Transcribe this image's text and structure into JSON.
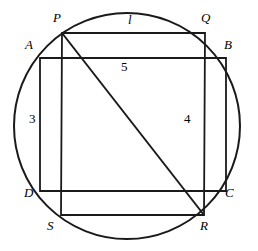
{
  "figure": {
    "background_color": "#ffffff",
    "stroke_color": "#1a1a1a"
  },
  "circle": {
    "name": "circumcircle",
    "center_x": 127,
    "center_y": 126,
    "radius": 113,
    "stroke_width": 2.0
  },
  "square_pqrs": {
    "name": "square-pqrs",
    "stroke_width": 1.8,
    "vertices": [
      {
        "label": "P",
        "x": 62,
        "y": 33,
        "label_x": 53,
        "label_y": 11
      },
      {
        "label": "Q",
        "x": 205,
        "y": 33,
        "label_x": 201,
        "label_y": 11
      },
      {
        "label": "R",
        "x": 204,
        "y": 215,
        "label_x": 200,
        "label_y": 219
      },
      {
        "label": "S",
        "x": 61,
        "y": 215,
        "label_x": 47,
        "label_y": 219
      }
    ]
  },
  "rectangle_abcd": {
    "name": "rectangle-abcd",
    "stroke_width": 1.8,
    "vertices": [
      {
        "label": "A",
        "x": 40,
        "y": 58,
        "label_x": 25,
        "label_y": 38
      },
      {
        "label": "B",
        "x": 226,
        "y": 58,
        "label_x": 224,
        "label_y": 38
      },
      {
        "label": "C",
        "x": 226,
        "y": 191,
        "label_x": 225,
        "label_y": 186
      },
      {
        "label": "D",
        "x": 40,
        "y": 191,
        "label_x": 24,
        "label_y": 186
      }
    ]
  },
  "diagonal": {
    "name": "diagonal-p-to-r",
    "from": "P",
    "to": "R",
    "x1": 62,
    "y1": 33,
    "x2": 204,
    "y2": 215,
    "stroke_width": 2.0
  },
  "measures": [
    {
      "id": "side-l",
      "text": "l",
      "x": 128,
      "y": 13,
      "italic": true,
      "description": "side PQ of square"
    },
    {
      "id": "width-3",
      "text": "3",
      "x": 29,
      "y": 112,
      "italic": false,
      "description": "side AD of rectangle"
    },
    {
      "id": "height-4",
      "text": "4",
      "x": 184,
      "y": 112,
      "italic": false,
      "description": "segment along right side"
    },
    {
      "id": "length-5",
      "text": "5",
      "x": 121,
      "y": 60,
      "italic": false,
      "description": "segment along AB"
    }
  ]
}
